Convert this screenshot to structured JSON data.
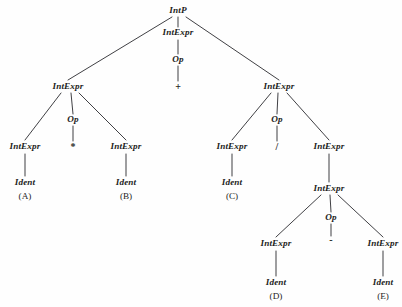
{
  "figure": {
    "kind": "parse-tree",
    "background_color": "#fefefe",
    "ink_color": "#1d1d22",
    "width": 402,
    "height": 307
  },
  "nodes": {
    "root": {
      "label": "IntP",
      "x": 178,
      "y": 11,
      "type": "nonterminal"
    },
    "top_mid_intexpr": {
      "label": "IntExpr",
      "x": 178,
      "y": 33,
      "type": "nonterminal"
    },
    "top_mid_op": {
      "label": "Op",
      "x": 178,
      "y": 60,
      "type": "nonterminal"
    },
    "top_mid_plus": {
      "label": "+",
      "x": 178,
      "y": 87,
      "type": "terminal"
    },
    "left_intexpr": {
      "label": "IntExpr",
      "x": 68,
      "y": 87,
      "type": "nonterminal"
    },
    "left_op": {
      "label": "Op",
      "x": 73,
      "y": 120,
      "type": "nonterminal"
    },
    "left_times": {
      "label": "*",
      "x": 73,
      "y": 147,
      "type": "terminal"
    },
    "left_a_intexpr": {
      "label": "IntExpr",
      "x": 25,
      "y": 147,
      "type": "nonterminal"
    },
    "left_a_ident": {
      "label": "Ident",
      "x": 25,
      "y": 183,
      "type": "nonterminal"
    },
    "left_a_letter": {
      "label": "(A)",
      "x": 25,
      "y": 197,
      "type": "terminal"
    },
    "left_b_intexpr": {
      "label": "IntExpr",
      "x": 126,
      "y": 147,
      "type": "nonterminal"
    },
    "left_b_ident": {
      "label": "Ident",
      "x": 126,
      "y": 183,
      "type": "nonterminal"
    },
    "left_b_letter": {
      "label": "(B)",
      "x": 126,
      "y": 197,
      "type": "terminal"
    },
    "right_intexpr": {
      "label": "IntExpr",
      "x": 279,
      "y": 87,
      "type": "nonterminal"
    },
    "right_op": {
      "label": "Op",
      "x": 277,
      "y": 120,
      "type": "nonterminal"
    },
    "right_divide": {
      "label": "/",
      "x": 277,
      "y": 147,
      "type": "terminal"
    },
    "right_c_intexpr": {
      "label": "IntExpr",
      "x": 232,
      "y": 147,
      "type": "nonterminal"
    },
    "right_c_ident": {
      "label": "Ident",
      "x": 232,
      "y": 183,
      "type": "nonterminal"
    },
    "right_c_letter": {
      "label": "(C)",
      "x": 232,
      "y": 197,
      "type": "terminal"
    },
    "right_sub_intexpr": {
      "label": "IntExpr",
      "x": 329,
      "y": 147,
      "type": "nonterminal"
    },
    "deep_intexpr": {
      "label": "IntExpr",
      "x": 329,
      "y": 189,
      "type": "nonterminal"
    },
    "deep_op": {
      "label": "Op",
      "x": 331,
      "y": 218,
      "type": "nonterminal"
    },
    "deep_minus": {
      "label": "-",
      "x": 331,
      "y": 240,
      "type": "terminal"
    },
    "deep_d_intexpr": {
      "label": "IntExpr",
      "x": 276,
      "y": 244,
      "type": "nonterminal"
    },
    "deep_d_ident": {
      "label": "Ident",
      "x": 276,
      "y": 283,
      "type": "nonterminal"
    },
    "deep_d_letter": {
      "label": "(D)",
      "x": 276,
      "y": 297,
      "type": "terminal"
    },
    "deep_e_intexpr": {
      "label": "IntExpr",
      "x": 383,
      "y": 244,
      "type": "nonterminal"
    },
    "deep_e_ident": {
      "label": "Ident",
      "x": 383,
      "y": 283,
      "type": "nonterminal"
    },
    "deep_e_letter": {
      "label": "(E)",
      "x": 383,
      "y": 297,
      "type": "terminal"
    }
  },
  "edges": [
    {
      "from": "root",
      "to": "left_intexpr",
      "x1": 172,
      "y1": 17,
      "x2": 68,
      "y2": 80
    },
    {
      "from": "root",
      "to": "top_mid_intexpr",
      "x1": 178,
      "y1": 17,
      "x2": 178,
      "y2": 27
    },
    {
      "from": "root",
      "to": "right_intexpr",
      "x1": 186,
      "y1": 17,
      "x2": 279,
      "y2": 80
    },
    {
      "from": "top_mid_intexpr",
      "to": "top_mid_op",
      "x1": 178,
      "y1": 40,
      "x2": 178,
      "y2": 54
    },
    {
      "from": "top_mid_op",
      "to": "top_mid_plus",
      "x1": 178,
      "y1": 66,
      "x2": 178,
      "y2": 81
    },
    {
      "from": "left_intexpr",
      "to": "left_a_intexpr",
      "x1": 61,
      "y1": 93,
      "x2": 25,
      "y2": 140
    },
    {
      "from": "left_intexpr",
      "to": "left_op",
      "x1": 71,
      "y1": 93,
      "x2": 73,
      "y2": 114
    },
    {
      "from": "left_intexpr",
      "to": "left_b_intexpr",
      "x1": 79,
      "y1": 93,
      "x2": 126,
      "y2": 140
    },
    {
      "from": "left_op",
      "to": "left_times",
      "x1": 73,
      "y1": 126,
      "x2": 73,
      "y2": 141
    },
    {
      "from": "left_a_intexpr",
      "to": "left_a_ident",
      "x1": 25,
      "y1": 154,
      "x2": 25,
      "y2": 176
    },
    {
      "from": "left_b_intexpr",
      "to": "left_b_ident",
      "x1": 126,
      "y1": 154,
      "x2": 126,
      "y2": 176
    },
    {
      "from": "right_intexpr",
      "to": "right_c_intexpr",
      "x1": 271,
      "y1": 93,
      "x2": 232,
      "y2": 140
    },
    {
      "from": "right_intexpr",
      "to": "right_op",
      "x1": 278,
      "y1": 93,
      "x2": 277,
      "y2": 114
    },
    {
      "from": "right_intexpr",
      "to": "right_sub_intexpr",
      "x1": 287,
      "y1": 93,
      "x2": 329,
      "y2": 140
    },
    {
      "from": "right_op",
      "to": "right_divide",
      "x1": 277,
      "y1": 126,
      "x2": 277,
      "y2": 141
    },
    {
      "from": "right_c_intexpr",
      "to": "right_c_ident",
      "x1": 232,
      "y1": 154,
      "x2": 232,
      "y2": 176
    },
    {
      "from": "right_sub_intexpr",
      "to": "deep_intexpr",
      "x1": 329,
      "y1": 154,
      "x2": 329,
      "y2": 182
    },
    {
      "from": "deep_intexpr",
      "to": "deep_d_intexpr",
      "x1": 321,
      "y1": 195,
      "x2": 276,
      "y2": 237
    },
    {
      "from": "deep_intexpr",
      "to": "deep_op",
      "x1": 330,
      "y1": 195,
      "x2": 331,
      "y2": 212
    },
    {
      "from": "deep_intexpr",
      "to": "deep_e_intexpr",
      "x1": 338,
      "y1": 195,
      "x2": 383,
      "y2": 237
    },
    {
      "from": "deep_op",
      "to": "deep_minus",
      "x1": 331,
      "y1": 224,
      "x2": 331,
      "y2": 236
    },
    {
      "from": "deep_d_intexpr",
      "to": "deep_d_ident",
      "x1": 276,
      "y1": 251,
      "x2": 276,
      "y2": 276
    },
    {
      "from": "deep_e_intexpr",
      "to": "deep_e_ident",
      "x1": 383,
      "y1": 251,
      "x2": 383,
      "y2": 276
    }
  ]
}
